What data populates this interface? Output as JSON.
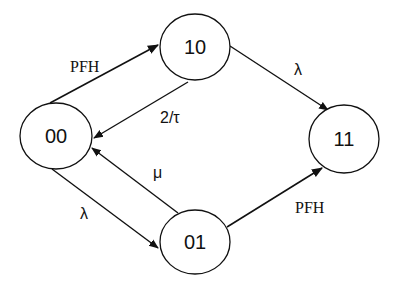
{
  "diagram": {
    "type": "state-transition",
    "nodes": [
      {
        "id": "10",
        "label": "10"
      },
      {
        "id": "00",
        "label": "00"
      },
      {
        "id": "11",
        "label": "11"
      },
      {
        "id": "01",
        "label": "01"
      }
    ],
    "edges": [
      {
        "from": "00",
        "to": "10",
        "label": "PFH"
      },
      {
        "from": "10",
        "to": "00",
        "label": "2/τ"
      },
      {
        "from": "10",
        "to": "11",
        "label": "λ"
      },
      {
        "from": "00",
        "to": "01",
        "label": "λ"
      },
      {
        "from": "01",
        "to": "00",
        "label": "μ"
      },
      {
        "from": "01",
        "to": "11",
        "label": "PFH"
      }
    ]
  },
  "labels": {
    "node_10": "10",
    "node_00": "00",
    "node_11": "11",
    "node_01": "01",
    "edge_00_10": "PFH",
    "edge_10_00": "2/τ",
    "edge_10_11": "λ",
    "edge_00_01": "λ",
    "edge_01_00": "μ",
    "edge_01_11": "PFH"
  }
}
